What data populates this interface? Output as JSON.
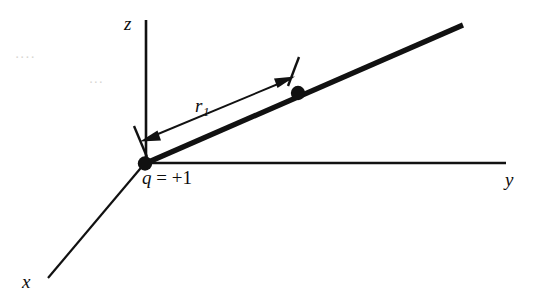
{
  "figure": {
    "kind": "3d-coordinate-axes-point-charge-diagram",
    "background_color": "#ffffff",
    "ink_color": "#111111",
    "axes": {
      "z": {
        "label": "z"
      },
      "y": {
        "label": "y"
      },
      "x": {
        "label": "x"
      }
    },
    "charge": {
      "label_full": "q = +1",
      "symbol": "q",
      "equals": " = ",
      "value": "+1"
    },
    "distance": {
      "symbol": "r",
      "subscript": "1",
      "label_full": "r1",
      "arrow_style": "double-headed"
    },
    "bleed_through": {
      "line1": "....",
      "line2": "..."
    }
  },
  "geometry": {
    "origin": {
      "x": 145,
      "y": 163
    },
    "z_axis_tip": {
      "x": 146,
      "y": 20
    },
    "y_axis_tip": {
      "x": 506,
      "y": 163
    },
    "x_axis_tip": {
      "x": 48,
      "y": 278
    },
    "ray_tip": {
      "x": 463,
      "y": 25
    },
    "field_point": {
      "x": 298,
      "y": 93
    },
    "dim_arrow_start": {
      "x": 143,
      "y": 141
    },
    "dim_arrow_end": {
      "x": 292,
      "y": 78
    }
  }
}
